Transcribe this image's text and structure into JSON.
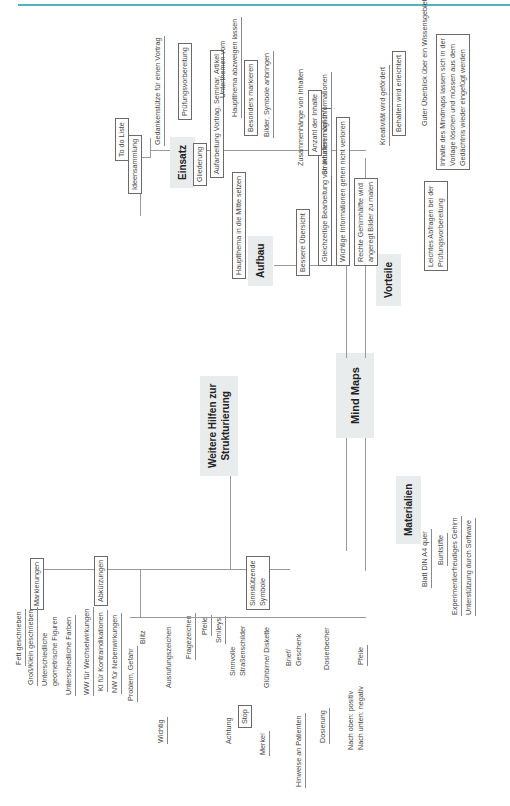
{
  "page": {
    "accent_color": "#4fb3bf"
  },
  "mindmap": {
    "center": "Mind Maps",
    "branches": {
      "einsatz": {
        "label": "Einsatz",
        "items": [
          "Ideensammlung",
          "To do Liste",
          "Gliederung"
        ],
        "gliederung_children": [
          "Gedankenstütze für einen Vortrag",
          "Prüfungsvorbereitung",
          "Aufarbeitung Vortrag, Seminar, Artikel"
        ]
      },
      "aufbau": {
        "label": "Aufbau",
        "items": [
          "Hauptthema in die Mitte setzen"
        ],
        "haupt_children": [
          "Unterthemen vom",
          "Hauptthema abzweigen lassen",
          "Besonders markieren",
          "Bilder, Symbole anbringen"
        ]
      },
      "vorteile": {
        "label": "Vorteile",
        "items": [
          "Bessere Übersicht",
          "Gleichzeitige Bearbeitung von Inhalten möglich",
          "Wichtige Informationen gehen nicht verloren",
          "Rechte Gehirnhälfte wird",
          "angeregt Bilder zu malen",
          "Leichtes Abfragen bei der",
          "Prüfungsvorbereitung"
        ],
        "uebersicht_children": [
          "Zusammenhänge von Inhalten",
          "Anzahl der Inhalte",
          "Strukturieren von Informationen"
        ],
        "gehirn_children": [
          "Kreativität wird gefördert",
          "Behalten wird erleichtert"
        ],
        "abfragen_children": [
          "Guter Überblick über ein Wissensgebiet",
          "Inhalte des Mindmaps lassen sich in der",
          "Vorlage löschen und müssen aus dem",
          "Gedächtnis wieder eingefügt werden"
        ]
      },
      "materialien": {
        "label": "Materialien",
        "items": [
          "Blatt DIN A4 quer",
          "Buntstifte",
          "Experimentierfreudiges Gehirn",
          "Unterstützung durch Software"
        ]
      },
      "weitere": {
        "label_line1": "Weitere Hilfen zur",
        "label_line2": "Strukturierung",
        "markierungen": {
          "label": "Markierungen",
          "items": [
            "Fett geschrieben",
            "Groß/Klein geschrieben",
            "Unterschiedliche",
            "geometrische Figuren",
            "Unterschiedliche Farben"
          ]
        },
        "abkuerzungen": {
          "label": "Abkürzungen",
          "items": [
            "WW für Wechselwirkungen",
            "KI für Kontraindikationen",
            "NW für Nebenwirkungen"
          ]
        },
        "symbole": {
          "label_line1": "Sinnstützende",
          "label_line2": "Symbole",
          "pairs": [
            {
              "meaning": "Problem, Gefahr",
              "symbol": "Blitz"
            },
            {
              "meaning": "Wichtig",
              "symbol": "Ausrufungszeichen"
            },
            {
              "meaning": "",
              "symbol": "Fragezeichen"
            },
            {
              "meaning": "",
              "symbol": "Pfeile"
            },
            {
              "meaning": "",
              "symbol": "Smileys"
            },
            {
              "meaning": "Achtung",
              "symbol": "Sinnvolle",
              "symbol2": "Straßenschilder",
              "sub": "Stop"
            },
            {
              "meaning": "Merke!",
              "symbol": "Glühbirne/ Diskette"
            },
            {
              "meaning": "Hinweise an Patienten",
              "symbol": "Brief/",
              "symbol2": "Geschenk"
            },
            {
              "meaning": "Dosierung",
              "symbol": "Dosierbecher"
            },
            {
              "meaning": "Nach oben: positiv",
              "meaning2": "Nach unten: negativ",
              "symbol": "Pfeile"
            }
          ]
        }
      }
    }
  }
}
